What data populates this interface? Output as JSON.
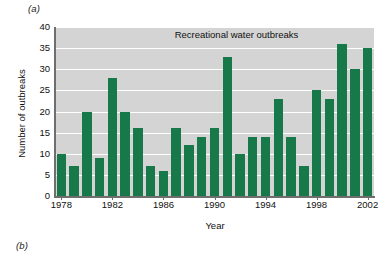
{
  "panels": {
    "a_label": "(a)",
    "b_label": "(b)"
  },
  "chart_data": {
    "type": "bar",
    "title": "Recreational water outbreaks",
    "xlabel": "Year",
    "ylabel": "Number of outbreaks",
    "ylim": [
      0,
      40
    ],
    "yticks": [
      0,
      5,
      10,
      15,
      20,
      25,
      30,
      35,
      40
    ],
    "xticks": [
      1978,
      1982,
      1986,
      1990,
      1994,
      1998,
      2002
    ],
    "grid": true,
    "legend": "none",
    "bar_color": "#17794a",
    "plot_background": "#d4d4d4",
    "categories": [
      1978,
      1979,
      1980,
      1981,
      1982,
      1983,
      1984,
      1985,
      1986,
      1987,
      1988,
      1989,
      1990,
      1991,
      1992,
      1993,
      1994,
      1995,
      1996,
      1997,
      1998,
      1999,
      2000,
      2001,
      2002
    ],
    "values": [
      10,
      7,
      20,
      9,
      28,
      20,
      16,
      7,
      6,
      16,
      12,
      14,
      16,
      33,
      10,
      14,
      14,
      23,
      14,
      7,
      25,
      23,
      36,
      30,
      35
    ]
  }
}
